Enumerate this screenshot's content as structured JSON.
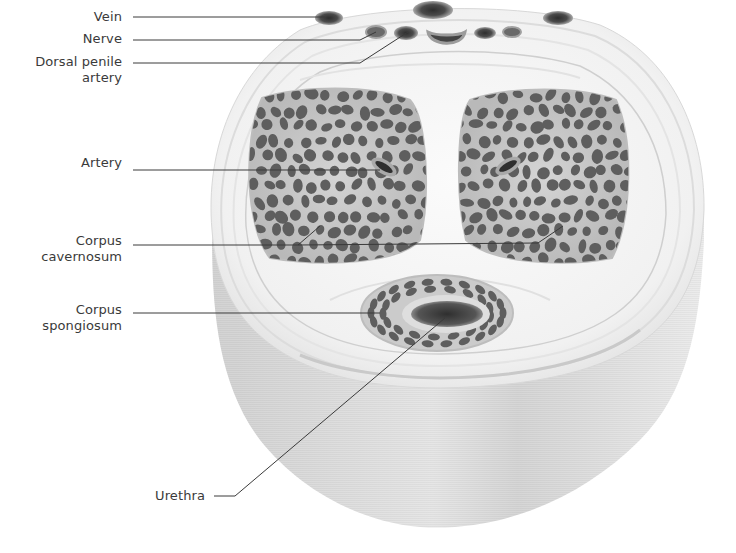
{
  "diagram": {
    "colors": {
      "background": "#ffffff",
      "tissue_light": "#f4f4f4",
      "tissue_mid": "#e4e4e4",
      "tissue_side": "#d9d9d9",
      "tissue_side_dark": "#cfcfcf",
      "cavernosum_fill": "#c8c8c8",
      "sinus_fill": "#5e5e5e",
      "vessel_dark": "#3d3d3d",
      "vessel_ring": "#9a9a9a",
      "leader_line": "#3a3a3a",
      "label_text": "#3a3a3a"
    },
    "labels": [
      {
        "id": "vein",
        "text": "Vein",
        "x": 40,
        "y": 9,
        "width": 82,
        "leader": [
          [
            133,
            17
          ],
          [
            325,
            17
          ]
        ]
      },
      {
        "id": "nerve",
        "text": "Nerve",
        "x": 40,
        "y": 31,
        "width": 82,
        "leader": [
          [
            133,
            40
          ],
          [
            360,
            40
          ],
          [
            376,
            32
          ]
        ]
      },
      {
        "id": "dorsal-penile-artery",
        "text": "Dorsal penile\nartery",
        "x": 10,
        "y": 54,
        "width": 112,
        "leader": [
          [
            133,
            63
          ],
          [
            360,
            63
          ],
          [
            408,
            32
          ]
        ]
      },
      {
        "id": "artery",
        "text": "Artery",
        "x": 40,
        "y": 155,
        "width": 82,
        "leader": [
          [
            133,
            170
          ],
          [
            380,
            170
          ]
        ]
      },
      {
        "id": "corpus-cavernosum",
        "text": "Corpus\ncavernosum",
        "x": 10,
        "y": 233,
        "width": 112,
        "leader": [
          [
            133,
            245
          ],
          [
            298,
            245
          ],
          [
            320,
            226
          ]
        ],
        "leader2": [
          [
            298,
            245
          ],
          [
            538,
            243
          ],
          [
            563,
            226
          ]
        ]
      },
      {
        "id": "corpus-spongiosum",
        "text": "Corpus\nspongiosum",
        "x": 10,
        "y": 302,
        "width": 112,
        "leader": [
          [
            133,
            313
          ],
          [
            380,
            313
          ]
        ]
      },
      {
        "id": "urethra",
        "text": "Urethra",
        "x": 110,
        "y": 484,
        "width": 100,
        "leader": [
          [
            214,
            496
          ],
          [
            235,
            496
          ],
          [
            445,
            318
          ]
        ]
      }
    ],
    "structures": {
      "veins": [
        {
          "cx": 329,
          "cy": 18,
          "rx": 14,
          "ry": 7
        },
        {
          "cx": 433,
          "cy": 10,
          "rx": 20,
          "ry": 9
        },
        {
          "cx": 558,
          "cy": 18,
          "rx": 15,
          "ry": 7
        }
      ],
      "nerves_arteries": [
        {
          "cx": 376,
          "cy": 32,
          "rx": 10,
          "ry": 6
        },
        {
          "cx": 406,
          "cy": 33,
          "rx": 12,
          "ry": 7
        },
        {
          "cx": 485,
          "cy": 33,
          "rx": 11,
          "ry": 6
        },
        {
          "cx": 512,
          "cy": 32,
          "rx": 9,
          "ry": 5
        }
      ],
      "deep_dorsal_vein": {
        "cx": 446,
        "cy": 38,
        "rx": 19,
        "ry": 10
      },
      "cavernosa": [
        {
          "cx": 334,
          "cy": 176,
          "rx": 92,
          "ry": 92,
          "artery": {
            "cx": 384,
            "cy": 167,
            "rot": 30
          }
        },
        {
          "cx": 539,
          "cy": 176,
          "rx": 92,
          "ry": 92,
          "artery": {
            "cx": 508,
            "cy": 166,
            "rot": -30
          }
        }
      ],
      "spongiosum": {
        "cx": 437,
        "cy": 313,
        "rx": 76,
        "ry": 38
      },
      "urethra_lumen": {
        "cx": 447,
        "cy": 314,
        "rx": 36,
        "ry": 13
      }
    }
  }
}
